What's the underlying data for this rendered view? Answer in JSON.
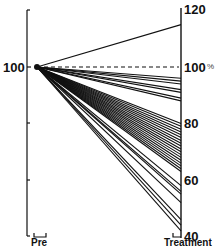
{
  "chart_data": {
    "type": "line",
    "title": "",
    "xlabel": "",
    "ylabel": "%",
    "categories": [
      "Pre",
      "Treatment"
    ],
    "left_axis": {
      "label_100": "100"
    },
    "right_axis": {
      "ticks": [
        "120",
        "100",
        "80",
        "60",
        "40"
      ],
      "unit": "%",
      "ylim": [
        40,
        120
      ]
    },
    "reference_line": {
      "value": 100,
      "style": "dashed"
    },
    "grid": false,
    "legend": null,
    "series_start_value": 100,
    "series_end_values": [
      115,
      96,
      95,
      94,
      92,
      91,
      89,
      88,
      80,
      79,
      78,
      77,
      76,
      75,
      74,
      73,
      72,
      71,
      70,
      69,
      68,
      67,
      66,
      65,
      64,
      63,
      58,
      56,
      55,
      52,
      46,
      44,
      42
    ]
  },
  "labels": {
    "left_100": "100",
    "right_120": "120",
    "right_100": "100",
    "right_pct": "%",
    "right_80": "80",
    "right_60": "60",
    "right_40": "40",
    "pre": "Pre",
    "treatment": "Treatment"
  }
}
